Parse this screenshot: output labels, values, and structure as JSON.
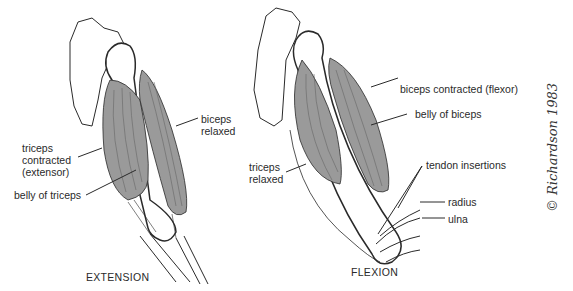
{
  "figure": {
    "panels": [
      {
        "id": "extension",
        "caption": "EXTENSION",
        "labels": {
          "biceps_line1": "biceps",
          "biceps_line2": "relaxed",
          "triceps_line1": "triceps",
          "triceps_line2": "contracted",
          "triceps_line3": "(extensor)",
          "belly": "belly of triceps"
        }
      },
      {
        "id": "flexion",
        "caption": "FLEXION",
        "labels": {
          "biceps": "biceps contracted (flexor)",
          "belly": "belly of biceps",
          "triceps_line1": "triceps",
          "triceps_line2": "relaxed",
          "tendon": "tendon insertions",
          "radius": "radius",
          "ulna": "ulna"
        }
      }
    ],
    "signature": "© Richardson 1983",
    "colors": {
      "muscle_fill": "#9a9a9a",
      "line": "#2a2a2a",
      "background": "#ffffff"
    }
  }
}
